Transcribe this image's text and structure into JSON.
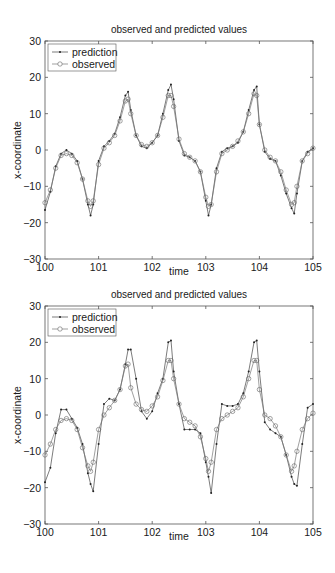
{
  "chart_data": [
    {
      "type": "line",
      "title": "observed and predicted values",
      "xlabel": "time",
      "ylabel": "x-coordinate",
      "xlim": [
        100,
        105
      ],
      "ylim": [
        -30,
        30
      ],
      "xticks": [
        "100",
        "101",
        "102",
        "103",
        "104",
        "105"
      ],
      "yticks": [
        "30",
        "20",
        "10",
        "0",
        "-10",
        "-20",
        "-30"
      ],
      "grid": false,
      "legend_position": "upper left",
      "x": [
        100.0,
        100.1,
        100.2,
        100.3,
        100.4,
        100.5,
        100.6,
        100.7,
        100.8,
        100.85,
        100.9,
        101.0,
        101.1,
        101.2,
        101.3,
        101.4,
        101.5,
        101.55,
        101.6,
        101.7,
        101.8,
        101.9,
        102.0,
        102.1,
        102.2,
        102.3,
        102.35,
        102.4,
        102.5,
        102.6,
        102.7,
        102.8,
        102.9,
        103.0,
        103.05,
        103.1,
        103.2,
        103.3,
        103.4,
        103.5,
        103.6,
        103.7,
        103.8,
        103.9,
        103.95,
        104.0,
        104.1,
        104.2,
        104.3,
        104.4,
        104.5,
        104.6,
        104.65,
        104.7,
        104.8,
        104.9,
        105.0
      ],
      "series": [
        {
          "name": "prediction",
          "marker": "dot",
          "values": [
            -16.5,
            -11.5,
            -4.5,
            -1,
            0,
            -1,
            -3,
            -8,
            -15,
            -18,
            -15,
            -3,
            1,
            2.5,
            4.5,
            9,
            15,
            16,
            11,
            4,
            1,
            0.5,
            2,
            4,
            10,
            16.5,
            18,
            14,
            2.5,
            -1.5,
            -2,
            -3,
            -6,
            -14,
            -18,
            -15,
            -5,
            -0.5,
            0.5,
            1,
            2,
            5,
            11,
            16.5,
            17.5,
            7,
            -0.5,
            -2.5,
            -3,
            -7,
            -12,
            -16,
            -17.5,
            -12,
            -3,
            -0.5,
            0.5
          ]
        },
        {
          "name": "observed",
          "marker": "circle",
          "values": [
            -14.5,
            -11,
            -5,
            -1.5,
            -1,
            -1.5,
            -3.5,
            -8,
            -14,
            -15.5,
            -14,
            -4,
            0.5,
            2,
            4,
            8,
            13.5,
            14,
            10,
            4,
            1.5,
            1,
            2,
            4,
            9,
            15,
            15,
            12,
            3,
            -1,
            -2,
            -3,
            -6,
            -13,
            -15.5,
            -15,
            -6,
            -1,
            0,
            1,
            2.5,
            5,
            10,
            15.5,
            15,
            7,
            0,
            -2,
            -3,
            -6,
            -11,
            -15,
            -14.5,
            -10,
            -3,
            -1,
            0.5
          ]
        }
      ]
    },
    {
      "type": "line",
      "title": "observed and predicted values",
      "xlabel": "time",
      "ylabel": "x-coordinate",
      "xlim": [
        100,
        105
      ],
      "ylim": [
        -30,
        30
      ],
      "xticks": [
        "100",
        "101",
        "102",
        "103",
        "104",
        "105"
      ],
      "yticks": [
        "30",
        "20",
        "10",
        "0",
        "-10",
        "-20",
        "-30"
      ],
      "grid": false,
      "legend_position": "upper left",
      "x": [
        100.0,
        100.1,
        100.2,
        100.3,
        100.4,
        100.5,
        100.6,
        100.7,
        100.8,
        100.85,
        100.9,
        101.0,
        101.1,
        101.2,
        101.3,
        101.4,
        101.5,
        101.55,
        101.6,
        101.7,
        101.8,
        101.9,
        102.0,
        102.1,
        102.2,
        102.3,
        102.35,
        102.4,
        102.5,
        102.6,
        102.7,
        102.8,
        102.9,
        103.0,
        103.05,
        103.1,
        103.2,
        103.3,
        103.4,
        103.5,
        103.6,
        103.7,
        103.8,
        103.9,
        103.95,
        104.0,
        104.1,
        104.2,
        104.3,
        104.4,
        104.5,
        104.6,
        104.65,
        104.7,
        104.8,
        104.9,
        105.0
      ],
      "series": [
        {
          "name": "prediction",
          "marker": "dot",
          "values": [
            -18.5,
            -14.5,
            -5,
            1.5,
            1.5,
            -1,
            -3.5,
            -8,
            -16,
            -19,
            -21,
            -8,
            3,
            4.5,
            4,
            7,
            14,
            18,
            18,
            10,
            1,
            -1,
            1,
            6,
            10,
            20,
            20.5,
            12,
            3,
            -4,
            -4,
            -4,
            -5,
            -13,
            -17,
            -21.5,
            -8,
            3,
            2.5,
            2.5,
            3,
            6,
            12,
            20,
            20.5,
            12,
            -2,
            -4,
            -5,
            -6,
            -11,
            -17,
            -19,
            -19.5,
            -8,
            2,
            3
          ]
        },
        {
          "name": "observed",
          "marker": "circle",
          "values": [
            -11,
            -8,
            -4,
            -1.5,
            -1,
            -1.5,
            -4,
            -9,
            -14,
            -15.5,
            -13,
            -4,
            0,
            2,
            4,
            7,
            13.5,
            14,
            7.5,
            3,
            1.5,
            1,
            2.5,
            5,
            9.5,
            15,
            15,
            10,
            3,
            -1,
            -2,
            -3,
            -6,
            -12,
            -15.5,
            -13,
            -4,
            -1,
            0,
            1,
            2,
            5,
            10,
            15,
            15,
            7,
            0,
            -1,
            -3,
            -6,
            -11,
            -15.5,
            -14,
            -10,
            -4,
            -1,
            0.5
          ]
        }
      ]
    }
  ],
  "charts": [
    {
      "title": "observed and predicted values",
      "xlabel": "time",
      "ylabel": "x-coordinate",
      "legend": {
        "prediction": "prediction",
        "observed": "observed"
      }
    },
    {
      "title": "observed and predicted values",
      "xlabel": "time",
      "ylabel": "x-coordinate",
      "legend": {
        "prediction": "prediction",
        "observed": "observed"
      }
    }
  ],
  "colors": {
    "line": "#333333",
    "axis": "#555555",
    "text": "#1a1a1a"
  }
}
